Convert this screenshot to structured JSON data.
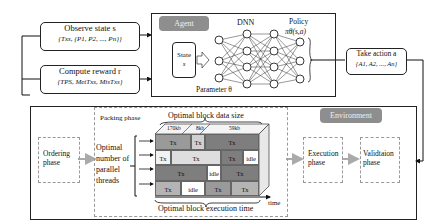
{
  "observe": {
    "title": "Observe state s",
    "sub": "{Txs, {P1, P2, ..., Pn}}"
  },
  "reward": {
    "title": "Compute reward r",
    "sub": "{TPS, MetTxs, MisTxs}"
  },
  "agent": {
    "tag": "Agent",
    "state_label": "State",
    "state_var": "s",
    "dnn_label": "DNN",
    "policy_label": "Policy",
    "policy_formula": "πθ(s,a)",
    "parameter_label": "Parameter θ"
  },
  "action": {
    "title": "Take action a",
    "sub": "{A1, A2, ..., An}"
  },
  "environment": {
    "tag": "Environment",
    "ordering_phase": "Ordering phase",
    "packing_phase": "Packing phase",
    "threads_label": "Optimal number of parallel threads",
    "data_size_label": "Optimal block data size",
    "exec_time_label": "Optimal block execution time",
    "time_axis": "time",
    "size_labels": [
      "170kb",
      "8kb",
      "59kb"
    ],
    "execution_phase": "Execution phase",
    "validation_phase": "Validtaion phase"
  },
  "grid_rows": [
    [
      {
        "t": "Tx",
        "w": 36,
        "c": "#9a9a9a"
      },
      {
        "t": "Tx",
        "w": 14,
        "c": "#d0d0d0"
      },
      {
        "t": "Tx",
        "w": 54,
        "c": "#7e7e7e"
      }
    ],
    [
      {
        "t": "Tx",
        "w": 16,
        "c": "#f2f2f2"
      },
      {
        "t": "Tx",
        "w": 50,
        "c": "#dedede"
      },
      {
        "t": "Tx",
        "w": 22,
        "c": "#7e7e7e"
      },
      {
        "t": "idle",
        "w": 16,
        "c": "#ffffff"
      }
    ],
    [
      {
        "t": "Tx",
        "w": 52,
        "c": "#7e7e7e"
      },
      {
        "t": "idle",
        "w": 14,
        "c": "#ffffff"
      },
      {
        "t": "Tx",
        "w": 38,
        "c": "#7e7e7e"
      }
    ],
    [
      {
        "t": "Tx",
        "w": 26,
        "c": "#b4b4b4"
      },
      {
        "t": "idle",
        "w": 24,
        "c": "#ffffff"
      },
      {
        "t": "Tx",
        "w": 26,
        "c": "#9a9a9a"
      },
      {
        "t": "Tx",
        "w": 28,
        "c": "#b4b4b4"
      }
    ]
  ]
}
